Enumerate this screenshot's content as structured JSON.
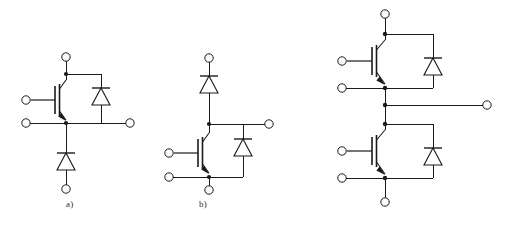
{
  "figure": {
    "background_color": "#ffffff",
    "line_color": "#1a1a1a",
    "width": 509,
    "height": 225
  },
  "labels": {
    "a": "a)",
    "b": "b)",
    "c": ""
  },
  "circuits": [
    {
      "id": "circuit-a",
      "label": "a)",
      "description": "Single IGBT with anti-parallel freewheeling diode, low-side configuration with series diode",
      "components": [
        {
          "type": "igbt",
          "name": "igbt-a1"
        },
        {
          "type": "diode",
          "name": "freewheel-diode-a1",
          "orientation": "cathode-up"
        },
        {
          "type": "diode",
          "name": "series-diode-a2",
          "orientation": "cathode-up"
        }
      ],
      "terminals": [
        {
          "name": "collector-terminal",
          "position": "top"
        },
        {
          "name": "gate-terminal",
          "position": "left-upper"
        },
        {
          "name": "emitter-terminal",
          "position": "left-lower"
        },
        {
          "name": "output-terminal",
          "position": "right"
        },
        {
          "name": "bottom-terminal",
          "position": "bottom"
        }
      ]
    },
    {
      "id": "circuit-b",
      "label": "b)",
      "description": "Single IGBT with series diode on top and anti-parallel freewheeling diode",
      "components": [
        {
          "type": "diode",
          "name": "series-diode-b1",
          "orientation": "cathode-up"
        },
        {
          "type": "igbt",
          "name": "igbt-b1"
        },
        {
          "type": "diode",
          "name": "freewheel-diode-b2",
          "orientation": "cathode-up"
        }
      ],
      "terminals": [
        {
          "name": "top-terminal",
          "position": "top"
        },
        {
          "name": "gate-terminal",
          "position": "left-upper"
        },
        {
          "name": "emitter-terminal",
          "position": "left-lower"
        },
        {
          "name": "collector-terminal",
          "position": "right"
        },
        {
          "name": "bottom-terminal",
          "position": "bottom"
        }
      ]
    },
    {
      "id": "circuit-c",
      "label": "",
      "description": "Half-bridge: two IGBTs with anti-parallel freewheeling diodes and common mid-point output",
      "components": [
        {
          "type": "igbt",
          "name": "igbt-c-high"
        },
        {
          "type": "diode",
          "name": "freewheel-diode-c-high",
          "orientation": "cathode-up"
        },
        {
          "type": "igbt",
          "name": "igbt-c-low"
        },
        {
          "type": "diode",
          "name": "freewheel-diode-c-low",
          "orientation": "cathode-up"
        }
      ],
      "terminals": [
        {
          "name": "dc-positive-terminal",
          "position": "top"
        },
        {
          "name": "gate-high-terminal",
          "position": "left-upper"
        },
        {
          "name": "emitter-high-terminal",
          "position": "left-upper-2"
        },
        {
          "name": "output-terminal",
          "position": "right-middle"
        },
        {
          "name": "gate-low-terminal",
          "position": "left-lower"
        },
        {
          "name": "emitter-low-terminal",
          "position": "left-lower-2"
        },
        {
          "name": "dc-negative-terminal",
          "position": "bottom"
        }
      ]
    }
  ]
}
